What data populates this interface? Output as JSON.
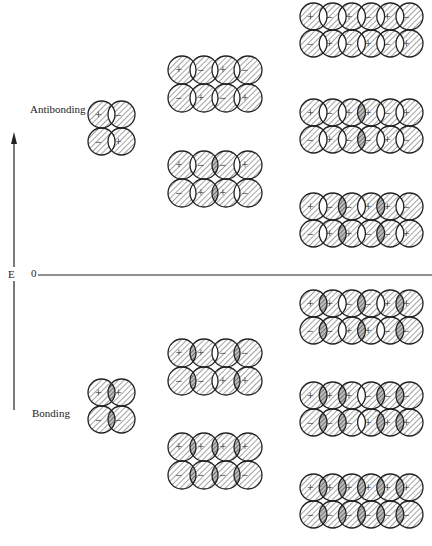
{
  "labels": {
    "antibonding": "Antibonding",
    "bonding": "Bonding",
    "energy_axis": "E",
    "zero": "0"
  },
  "colors": {
    "ink": "#222222",
    "hatch": "#555555",
    "dark_overlap": "#9a9a9a",
    "background": "#ffffff"
  },
  "orbital_sets": [
    {
      "atoms": 2,
      "x": 88,
      "step": 20,
      "r": 13.5,
      "levels": [
        {
          "y": 101,
          "top": [
            "+",
            "-"
          ],
          "bottom": [
            "-",
            "+"
          ],
          "dark": []
        },
        {
          "y": 379,
          "top": [
            "+",
            "+"
          ],
          "bottom": [
            "-",
            "-"
          ],
          "dark": [
            0
          ]
        }
      ]
    },
    {
      "atoms": 4,
      "x": 168,
      "step": 22,
      "r": 14,
      "levels": [
        {
          "y": 56,
          "top": [
            "+",
            "-",
            "+",
            "-"
          ],
          "bottom": [
            "-",
            "+",
            "-",
            "+"
          ],
          "dark": []
        },
        {
          "y": 151,
          "top": [
            "+",
            "-",
            "-",
            "+"
          ],
          "bottom": [
            "-",
            "+",
            "+",
            "-"
          ],
          "dark": [
            1
          ]
        },
        {
          "y": 339,
          "top": [
            "+",
            "+",
            "-",
            "-"
          ],
          "bottom": [
            "-",
            "-",
            "+",
            "+"
          ],
          "dark": [
            0,
            2
          ]
        },
        {
          "y": 433,
          "top": [
            "+",
            "+",
            "+",
            "+"
          ],
          "bottom": [
            "-",
            "-",
            "-",
            "-"
          ],
          "dark": [
            0,
            1,
            2
          ]
        }
      ]
    },
    {
      "atoms": 6,
      "x": 300,
      "step": 19.2,
      "r": 13.5,
      "levels": [
        {
          "y": 3,
          "top": [
            "+",
            "-",
            "+",
            "-",
            "+",
            "-"
          ],
          "bottom": [
            "-",
            "+",
            "-",
            "+",
            "-",
            "+"
          ],
          "dark": []
        },
        {
          "y": 99,
          "top": [
            "+",
            "-",
            "+",
            "+",
            "-",
            "+"
          ],
          "bottom": [
            "-",
            "+",
            "-",
            "-",
            "+",
            "-"
          ],
          "dark": [
            2
          ]
        },
        {
          "y": 193,
          "top": [
            "+",
            "-",
            "-",
            "+",
            "+",
            "-"
          ],
          "bottom": [
            "-",
            "+",
            "+",
            "-",
            "-",
            "+"
          ],
          "dark": [
            1,
            3
          ]
        },
        {
          "y": 290,
          "top": [
            "+",
            "+",
            "-",
            "-",
            "+",
            "+"
          ],
          "bottom": [
            "-",
            "-",
            "+",
            "+",
            "-",
            "-"
          ],
          "dark": [
            0,
            2,
            4
          ]
        },
        {
          "y": 382,
          "top": [
            "+",
            "+",
            "+",
            "-",
            "-",
            "-"
          ],
          "bottom": [
            "-",
            "-",
            "-",
            "+",
            "+",
            "+"
          ],
          "dark": [
            0,
            1,
            3,
            4
          ]
        },
        {
          "y": 474,
          "top": [
            "+",
            "+",
            "+",
            "+",
            "+",
            "+"
          ],
          "bottom": [
            "-",
            "-",
            "-",
            "-",
            "-",
            "-"
          ],
          "dark": [
            0,
            1,
            2,
            3,
            4
          ]
        }
      ]
    }
  ]
}
